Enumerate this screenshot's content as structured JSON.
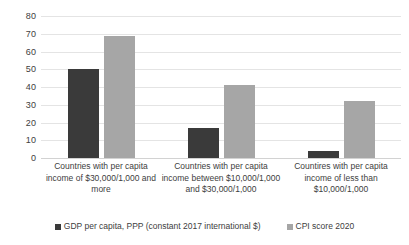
{
  "chart_data": {
    "type": "bar",
    "title": "",
    "xlabel": "",
    "ylabel": "",
    "ylim": [
      0,
      80
    ],
    "ytick_step": 10,
    "yticks": [
      "80",
      "70",
      "60",
      "50",
      "40",
      "30",
      "20",
      "10",
      "0"
    ],
    "grid": true,
    "legend_position": "bottom",
    "categories": [
      "Countries with per capita income of $30,000/1,000 and more",
      "Countries with per capita income between $10,000/1,000 and $30,000/1,000",
      "Countires with per capita income of less than $10,000/1,000"
    ],
    "series": [
      {
        "name": "GDP per capita, PPP (constant 2017 international $)",
        "color": "#3a3a3a",
        "values": [
          50,
          17,
          4
        ]
      },
      {
        "name": "CPI score 2020",
        "color": "#a6a6a6",
        "values": [
          69,
          41,
          32
        ]
      }
    ]
  },
  "colors": {
    "series_dark": "#3a3a3a",
    "series_light": "#a6a6a6",
    "gridline": "#e4e4e4",
    "baseline": "#d2d2d2",
    "background": "#ffffff",
    "text": "#404040"
  }
}
